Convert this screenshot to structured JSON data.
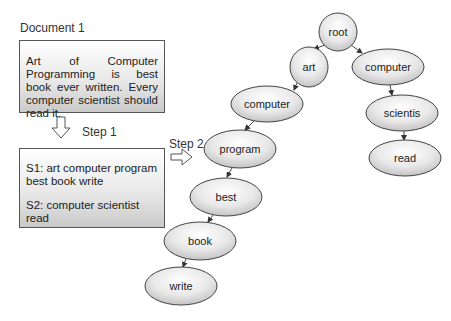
{
  "document": {
    "title": "Document 1",
    "text": "Art of Computer Programming is best book ever written. Every computer scientist should read it."
  },
  "step1": {
    "label": "Step 1",
    "sentences": [
      "S1: art computer program best book write",
      "S2: computer scientist read"
    ]
  },
  "step2": {
    "label": "Step 2"
  },
  "tree": {
    "nodes": [
      {
        "id": "root",
        "label": "root"
      },
      {
        "id": "art",
        "label": "art"
      },
      {
        "id": "computer-right",
        "label": "computer"
      },
      {
        "id": "computer-left",
        "label": "computer"
      },
      {
        "id": "scientis",
        "label": "scientis"
      },
      {
        "id": "program",
        "label": "program"
      },
      {
        "id": "read",
        "label": "read"
      },
      {
        "id": "best",
        "label": "best"
      },
      {
        "id": "book",
        "label": "book"
      },
      {
        "id": "write",
        "label": "write"
      }
    ],
    "edges": [
      [
        "root",
        "art"
      ],
      [
        "root",
        "computer-right"
      ],
      [
        "art",
        "computer-left"
      ],
      [
        "computer-left",
        "program"
      ],
      [
        "program",
        "best"
      ],
      [
        "best",
        "book"
      ],
      [
        "book",
        "write"
      ],
      [
        "computer-right",
        "scientis"
      ],
      [
        "scientis",
        "read"
      ]
    ]
  }
}
